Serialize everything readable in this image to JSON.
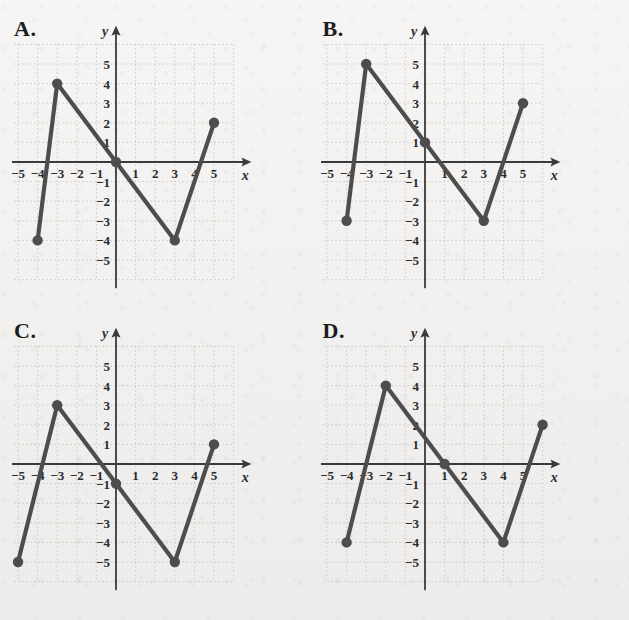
{
  "page": {
    "kind": "multiple-choice-graph-figure",
    "background_color": "#f2f1ef",
    "line_color": "#4d4d4d",
    "axis_color": "#3a3a3a",
    "grid_color": "#c9c6c2",
    "label_color": "#2b2b2b"
  },
  "axes_common": {
    "x_label": "x",
    "y_label": "y",
    "x_ticks": [
      "−5",
      "−4",
      "−3",
      "−2",
      "−1",
      "1",
      "2",
      "3",
      "4",
      "5"
    ],
    "x_tick_values": [
      -5,
      -4,
      -3,
      -2,
      -1,
      1,
      2,
      3,
      4,
      5
    ],
    "y_ticks": [
      "5",
      "4",
      "3",
      "2",
      "1",
      "−1",
      "−2",
      "−3",
      "−4",
      "−5"
    ],
    "y_tick_values": [
      5,
      4,
      3,
      2,
      1,
      -1,
      -2,
      -3,
      -4,
      -5
    ],
    "xlim": [
      -6.2,
      6.2
    ],
    "ylim": [
      -6.2,
      6.2
    ],
    "grid": true,
    "grid_style": "dotted"
  },
  "panels": [
    {
      "id": "A",
      "letter": "A.",
      "label": "graph-option-a"
    },
    {
      "id": "B",
      "letter": "B.",
      "label": "graph-option-b"
    },
    {
      "id": "C",
      "letter": "C.",
      "label": "graph-option-c"
    },
    {
      "id": "D",
      "letter": "D.",
      "label": "graph-option-d"
    }
  ],
  "chart_data": [
    {
      "id": "A",
      "type": "line",
      "title": "A.",
      "xlabel": "x",
      "ylabel": "y",
      "xlim": [
        -6.2,
        6.2
      ],
      "ylim": [
        -6.2,
        6.2
      ],
      "grid": true,
      "legend": "none",
      "markers": "filled-circle",
      "points": [
        {
          "x": -4,
          "y": -4
        },
        {
          "x": -3,
          "y": 4
        },
        {
          "x": 0,
          "y": 0
        },
        {
          "x": 3,
          "y": -4
        },
        {
          "x": 5,
          "y": 2
        }
      ],
      "x": [
        -4,
        -3,
        0,
        3,
        5
      ],
      "values": [
        -4,
        4,
        0,
        -4,
        2
      ]
    },
    {
      "id": "B",
      "type": "line",
      "title": "B.",
      "xlabel": "x",
      "ylabel": "y",
      "xlim": [
        -6.2,
        6.2
      ],
      "ylim": [
        -6.2,
        6.2
      ],
      "grid": true,
      "legend": "none",
      "markers": "filled-circle",
      "points": [
        {
          "x": -4,
          "y": -3
        },
        {
          "x": -3,
          "y": 5
        },
        {
          "x": 0,
          "y": 1
        },
        {
          "x": 3,
          "y": -3
        },
        {
          "x": 5,
          "y": 3
        }
      ],
      "x": [
        -4,
        -3,
        0,
        3,
        5
      ],
      "values": [
        -3,
        5,
        1,
        -3,
        3
      ]
    },
    {
      "id": "C",
      "type": "line",
      "title": "C.",
      "xlabel": "x",
      "ylabel": "y",
      "xlim": [
        -6.2,
        6.2
      ],
      "ylim": [
        -6.2,
        6.2
      ],
      "grid": true,
      "legend": "none",
      "markers": "filled-circle",
      "points": [
        {
          "x": -5,
          "y": -5
        },
        {
          "x": -3,
          "y": 3
        },
        {
          "x": 0,
          "y": -1
        },
        {
          "x": 3,
          "y": -5
        },
        {
          "x": 5,
          "y": 1
        }
      ],
      "x": [
        -5,
        -3,
        0,
        3,
        5
      ],
      "values": [
        -5,
        3,
        -1,
        -5,
        1
      ]
    },
    {
      "id": "D",
      "type": "line",
      "title": "D.",
      "xlabel": "x",
      "ylabel": "y",
      "xlim": [
        -6.2,
        6.2
      ],
      "ylim": [
        -6.2,
        6.2
      ],
      "grid": true,
      "legend": "none",
      "markers": "filled-circle",
      "points": [
        {
          "x": -4,
          "y": -4
        },
        {
          "x": -2,
          "y": 4
        },
        {
          "x": 1,
          "y": 0
        },
        {
          "x": 4,
          "y": -4
        },
        {
          "x": 6,
          "y": 2
        }
      ],
      "x": [
        -4,
        -2,
        1,
        4,
        6
      ],
      "values": [
        -4,
        4,
        0,
        -4,
        2
      ]
    }
  ]
}
